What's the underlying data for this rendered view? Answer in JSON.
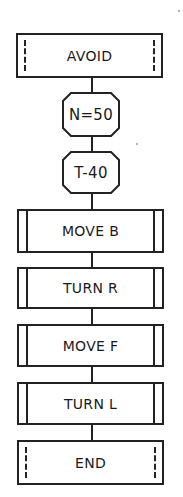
{
  "flowchart": {
    "nodes": [
      {
        "id": "avoid",
        "label": "AVOID",
        "shape": "terminal"
      },
      {
        "id": "n50",
        "label": "N=50",
        "shape": "octagon"
      },
      {
        "id": "t40",
        "label": "T-40",
        "shape": "octagon"
      },
      {
        "id": "moveb",
        "label": "MOVE B",
        "shape": "process"
      },
      {
        "id": "turnr",
        "label": "TURN R",
        "shape": "process"
      },
      {
        "id": "movef",
        "label": "MOVE F",
        "shape": "process"
      },
      {
        "id": "turnl",
        "label": "TURN L",
        "shape": "process"
      },
      {
        "id": "end",
        "label": "END",
        "shape": "terminal"
      }
    ],
    "edges": [
      [
        "avoid",
        "n50"
      ],
      [
        "n50",
        "t40"
      ],
      [
        "t40",
        "moveb"
      ],
      [
        "moveb",
        "turnr"
      ],
      [
        "turnr",
        "movef"
      ],
      [
        "movef",
        "turnl"
      ],
      [
        "turnl",
        "end"
      ]
    ]
  }
}
